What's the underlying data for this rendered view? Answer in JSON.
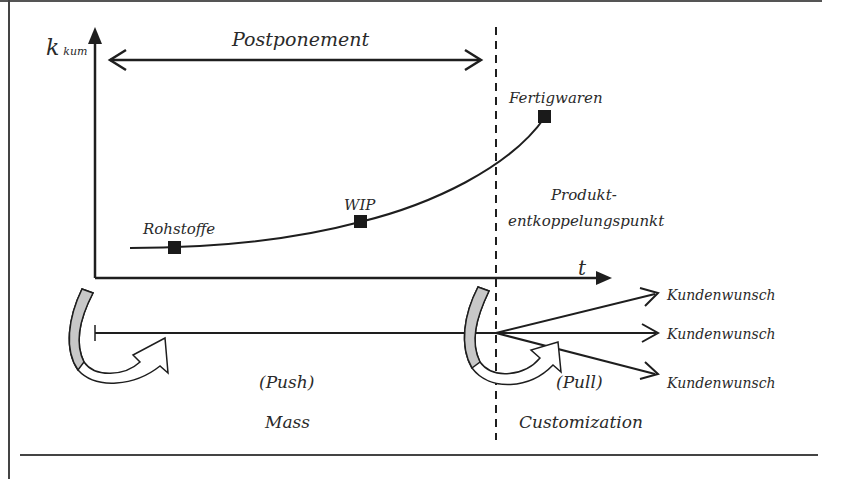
{
  "diagram": {
    "axes": {
      "y_label_main": "k",
      "y_label_sub": "kum",
      "x_label": "t"
    },
    "postponement_label": "Postponement",
    "points": [
      {
        "label": "Rohstoffe"
      },
      {
        "label": "WIP"
      },
      {
        "label": "Fertigwaren"
      }
    ],
    "decoupling_point": {
      "line1": "Produkt-",
      "line2": "entkoppelungspunkt"
    },
    "customer_wishes": [
      {
        "label": "Kundenwunsch"
      },
      {
        "label": "Kundenwunsch"
      },
      {
        "label": "Kundenwunsch"
      }
    ],
    "push_label": "(Push)",
    "pull_label": "(Pull)",
    "mass_label": "Mass",
    "customization_label": "Customization",
    "colors": {
      "line": "#1e1e1e",
      "marker": "#1a1a1a",
      "curved_arrow_fill": "#c8c8c8",
      "background": "#ffffff"
    }
  }
}
